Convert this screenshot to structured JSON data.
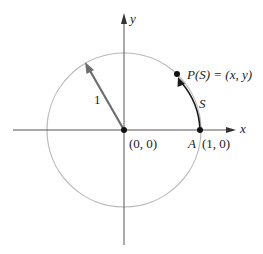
{
  "diagram": {
    "type": "unit-circle",
    "colors": {
      "axis": "#555555",
      "circle": "#b8b8b8",
      "radius_arrow": "#6e6e6e",
      "arc": "#1a1a1a",
      "point": "#111111",
      "text": "#222222"
    },
    "axes": {
      "x_label": "x",
      "y_label": "y"
    },
    "labels": {
      "origin": "(0, 0)",
      "point_a_name": "A",
      "point_a_coords": "(1, 0)",
      "point_p": "P(S) = (x, y)",
      "arc_length": "S",
      "radius": "1"
    }
  }
}
